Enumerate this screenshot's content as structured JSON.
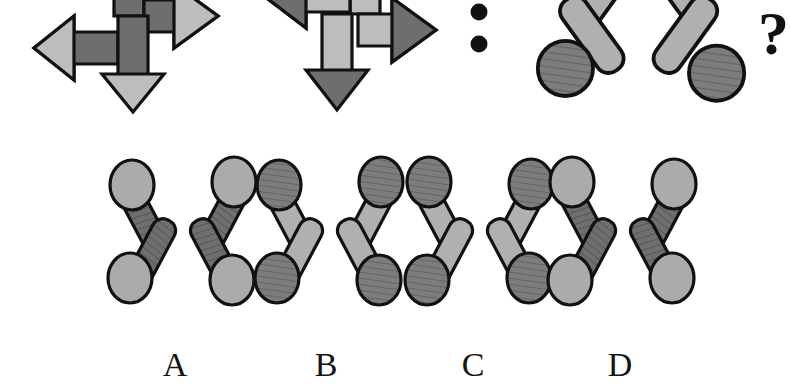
{
  "puzzle": {
    "type": "visual-analogy",
    "relation_symbol": ":",
    "question_symbol": "?",
    "prompt_row": {
      "items": [
        {
          "name": "arrow-figure-1",
          "kind": "tri-arrow",
          "description": "Three arrows: left, right, down. Dark gray shafts with light gray arrowheads.",
          "shaft_color": "#6e6e6e",
          "head_color": "#bdbdbd",
          "outline_color": "#111111",
          "arrows": [
            "left",
            "right",
            "down"
          ],
          "clipped": "top"
        },
        {
          "name": "arrow-figure-2",
          "kind": "tri-arrow",
          "description": "Three arrows: left, right, down. Light gray shafts with dark gray arrowheads.",
          "shaft_color": "#bdbdbd",
          "head_color": "#6e6e6e",
          "outline_color": "#111111",
          "arrows": [
            "left",
            "right",
            "down"
          ],
          "clipped": "top"
        },
        {
          "name": "colon-separator",
          "kind": "colon"
        },
        {
          "name": "x-figure-question",
          "kind": "x-figure",
          "description": "X shaped figure, dark hatched circles with light gray rods.",
          "circle_color": "#8a8a8a",
          "circle_hatched": true,
          "rod_color": "#b0b0b0",
          "rod_hatched": false,
          "outline_color": "#111111",
          "clipped": "top"
        },
        {
          "name": "question-mark",
          "kind": "question-mark",
          "clipped": "right"
        }
      ]
    },
    "options": [
      {
        "id": "A",
        "label": "A",
        "circle_color": "#ababab",
        "circle_hatched": false,
        "rod_color": "#6f6f6f",
        "rod_hatched": true,
        "outline_color": "#111111",
        "description": "Light gray plain circles with dark hatched rods."
      },
      {
        "id": "B",
        "label": "B",
        "circle_color": "#777777",
        "circle_hatched": true,
        "rod_color": "#b0b0b0",
        "rod_hatched": false,
        "outline_color": "#111111",
        "description": "Dark hatched circles with light gray plain rods."
      },
      {
        "id": "C",
        "label": "C",
        "circle_color": "#777777",
        "circle_hatched": true,
        "rod_color": "#b0b0b0",
        "rod_hatched": false,
        "outline_color": "#111111",
        "description": "Dark hatched circles with light gray plain rods, mirrored."
      },
      {
        "id": "D",
        "label": "D",
        "circle_color": "#ababab",
        "circle_hatched": false,
        "rod_color": "#6f6f6f",
        "rod_hatched": true,
        "outline_color": "#111111",
        "description": "Light gray plain circles with dark hatched rods, mirrored."
      }
    ],
    "colors": {
      "background": "#ffffff",
      "ink": "#111111",
      "light_gray": "#bdbdbd",
      "mid_gray": "#ababab",
      "dark_gray": "#6e6e6e"
    }
  }
}
